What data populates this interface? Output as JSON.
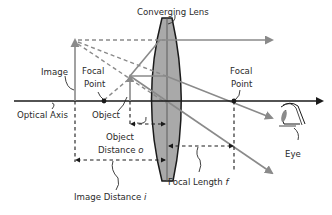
{
  "diagram": {
    "labels": {
      "lens": "Converging Lens",
      "image": "Image",
      "focal_point_left_line1": "Focal",
      "focal_point_left_line2": "Point",
      "focal_point_right_line1": "Focal",
      "focal_point_right_line2": "Point",
      "optical_axis": "Optical Axis",
      "object": "Object",
      "object_distance_line1": "Object",
      "object_distance_line2": "Distance ",
      "object_distance_symbol": "o",
      "image_distance": "Image Distance ",
      "image_distance_symbol": "i",
      "focal_length": "Focal Length ",
      "focal_length_symbol": "f",
      "eye": "Eye"
    },
    "colors": {
      "axis": "#1a1a1a",
      "rays": "#8a8a8a",
      "lens_fill": "#a9a9a9",
      "text": "#2a2a2a"
    }
  }
}
